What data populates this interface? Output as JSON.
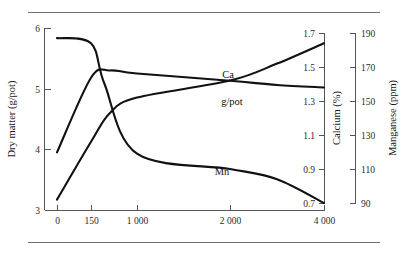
{
  "figure": {
    "has_top_rule": true,
    "has_bottom_rule": true,
    "rule_color": "#6f6f6f",
    "background": "#ffffff"
  },
  "chart_data": {
    "type": "line",
    "title": "",
    "xlabel": "",
    "grid": false,
    "legend_position": "inline-labels",
    "x_axis": {
      "tick_labels": [
        "0",
        "150",
        "1 000",
        "2 000",
        "4 000"
      ],
      "tick_values": [
        0,
        150,
        1000,
        2000,
        4000
      ],
      "scale": "non-linear (compressed low range)"
    },
    "axes": [
      {
        "name": "dry-matter",
        "title": "Dry matter (g/pot)",
        "side": "left",
        "tick_labels": [
          "3",
          "4",
          "5",
          "6"
        ],
        "tick_values": [
          3,
          4,
          5,
          6
        ],
        "ylim": [
          3,
          6
        ]
      },
      {
        "name": "calcium",
        "title": "Calcium (%)",
        "side": "right-inner",
        "tick_labels": [
          "0.7",
          "0.9",
          "1.1",
          "1.3",
          "1.5",
          "1.7"
        ],
        "tick_values": [
          0.7,
          0.9,
          1.1,
          1.3,
          1.5,
          1.7
        ],
        "ylim": [
          0.7,
          1.7
        ]
      },
      {
        "name": "manganese",
        "title": "Manganese (ppm)",
        "side": "right-outer",
        "tick_labels": [
          "90",
          "110",
          "130",
          "150",
          "170",
          "190"
        ],
        "tick_values": [
          90,
          110,
          130,
          150,
          170,
          190
        ],
        "ylim": [
          90,
          190
        ]
      }
    ],
    "series": [
      {
        "name": "Ca",
        "label": "Ca",
        "axis": "calcium",
        "color": "#111111",
        "x": [
          0,
          150,
          500,
          1000,
          2000,
          3000,
          4000
        ],
        "values": [
          0.72,
          1.06,
          1.23,
          1.32,
          1.42,
          1.52,
          1.64
        ]
      },
      {
        "name": "g/pot",
        "label": "g/pot",
        "axis": "dry-matter",
        "color": "#111111",
        "x": [
          0,
          150,
          500,
          1000,
          2000,
          3000,
          4000
        ],
        "values": [
          3.95,
          5.18,
          5.3,
          5.25,
          5.13,
          5.06,
          5.02
        ]
      },
      {
        "name": "Mn",
        "label": "Mn",
        "axis": "manganese",
        "color": "#111111",
        "x": [
          0,
          150,
          400,
          1000,
          2000,
          3000,
          4000
        ],
        "values": [
          187,
          184,
          160,
          119,
          110,
          104,
          90
        ]
      }
    ],
    "curve_labels": [
      {
        "text": "Ca",
        "x": 228,
        "y": 78
      },
      {
        "text": "g/pot",
        "x": 232,
        "y": 105
      },
      {
        "text": "Mn",
        "x": 222,
        "y": 175
      }
    ]
  }
}
